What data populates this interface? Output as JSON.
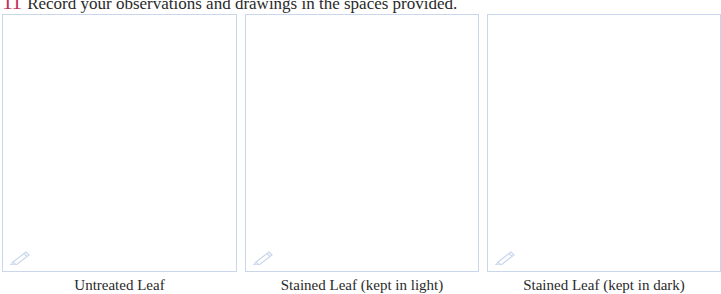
{
  "heading": {
    "number": "11",
    "text": "Record your observations and drawings in the spaces provided."
  },
  "panels": [
    {
      "caption": "Untreated Leaf",
      "icon": "pencil-icon"
    },
    {
      "caption": "Stained Leaf (kept in light)",
      "icon": "pencil-icon"
    },
    {
      "caption": "Stained Leaf (kept in dark)",
      "icon": "pencil-icon"
    }
  ],
  "colors": {
    "number": "#c2325a",
    "box_border": "#c9d6ec",
    "icon": "#c9d6ec"
  }
}
